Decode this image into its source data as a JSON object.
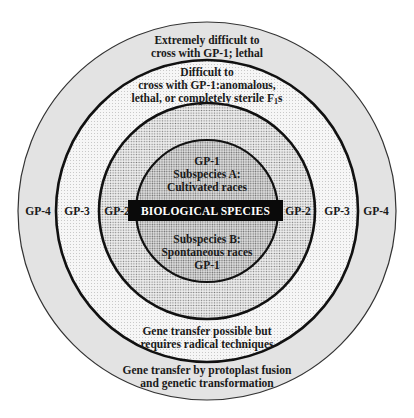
{
  "diagram": {
    "center": {
      "x": 207,
      "y": 211
    },
    "rings": [
      {
        "id": "GP-4",
        "radius": 189,
        "fill": "#e3e3e3",
        "stroke": "#333333",
        "stroke_width": 1.2
      },
      {
        "id": "GP-3",
        "radius": 151,
        "fill": "#f4f4f4",
        "stroke": "#111111",
        "stroke_width": 2.6
      },
      {
        "id": "GP-2",
        "radius": 108,
        "fill": "#e6e6e6",
        "stroke": "#111111",
        "stroke_width": 2.6
      },
      {
        "id": "GP-1",
        "radius": 71,
        "fill": "#dcdcdc",
        "stroke": "#111111",
        "stroke_width": 2.2
      }
    ],
    "banner": {
      "label": "BIOLOGICAL SPECIES",
      "bg": "#0a0a0a",
      "color": "#ffffff"
    },
    "gp1": {
      "top_lines": [
        "GP-1",
        "Subspecies A:",
        "Cultivated races"
      ],
      "bottom_lines": [
        "Subspecies B:",
        "Spontaneous races",
        "GP-1"
      ]
    },
    "side_labels": {
      "left": [
        "GP-4",
        "GP-3",
        "GP-2"
      ],
      "right": [
        "GP-2",
        "GP-3",
        "GP-4"
      ]
    },
    "gp4_top": [
      "Extremely difficult to",
      "cross with GP-1; lethal"
    ],
    "gp3_top": {
      "line1": "Difficult to",
      "line2": "cross with GP-1:anomalous,",
      "line3_main": "lethal, or completely sterile F",
      "line3_sub": "1",
      "line3_tail": "s"
    },
    "gp3_bottom": [
      "Gene transfer possible but",
      "requires radical techniques"
    ],
    "gp4_bottom": [
      "Gene transfer by protoplast fusion",
      "and genetic transformation"
    ]
  }
}
